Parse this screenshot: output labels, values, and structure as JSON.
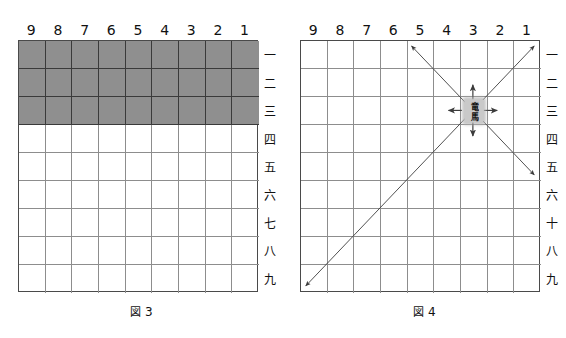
{
  "figures": [
    {
      "id": "figure-3",
      "caption_mark": "図",
      "caption_number": "3",
      "columns": [
        "9",
        "8",
        "7",
        "6",
        "5",
        "4",
        "3",
        "2",
        "1"
      ],
      "rows": [
        "一",
        "二",
        "三",
        "四",
        "五",
        "六",
        "七",
        "八",
        "九"
      ],
      "shaded_rows": [
        1,
        2,
        3
      ],
      "shaded_columns": [
        1,
        2,
        3,
        4,
        5,
        6,
        7,
        8,
        9
      ],
      "piece": null
    },
    {
      "id": "figure-4",
      "caption_mark": "図",
      "caption_number": "4",
      "columns": [
        "9",
        "8",
        "7",
        "6",
        "5",
        "4",
        "3",
        "2",
        "1"
      ],
      "rows": [
        "一",
        "二",
        "三",
        "四",
        "五",
        "六",
        "十",
        "八",
        "九"
      ],
      "shaded_rows": [],
      "shaded_columns": [],
      "piece": {
        "name": "竜馬",
        "top_char": "竜",
        "bottom_char": "馬",
        "file": "3",
        "rank": "三"
      },
      "arrows": [
        {
          "name": "arrow-up",
          "dir": "up",
          "length": "one-square"
        },
        {
          "name": "arrow-down",
          "dir": "down",
          "length": "one-square"
        },
        {
          "name": "arrow-left",
          "dir": "left",
          "length": "one-square"
        },
        {
          "name": "arrow-right",
          "dir": "right",
          "length": "one-square"
        },
        {
          "name": "arrow-up-left",
          "dir": "up-left",
          "length": "to-edge"
        },
        {
          "name": "arrow-up-right",
          "dir": "up-right",
          "length": "to-edge"
        },
        {
          "name": "arrow-down-left",
          "dir": "down-left",
          "length": "to-edge"
        },
        {
          "name": "arrow-down-right",
          "dir": "down-right",
          "length": "to-edge"
        }
      ]
    }
  ],
  "colors": {
    "shade": "#8f8f8f",
    "grid_line": "#8d8d8d",
    "border": "#4a4a4a",
    "arrow": "#3b3b3b",
    "text": "#111111",
    "background": "#ffffff"
  }
}
